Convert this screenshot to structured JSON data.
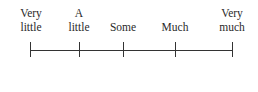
{
  "scale": {
    "anchors": [
      {
        "line1": "Very",
        "line2": "little"
      },
      {
        "line1": "A",
        "line2": "little"
      },
      {
        "line1": "",
        "line2": "Some"
      },
      {
        "line1": "",
        "line2": "Much"
      },
      {
        "line1": "Very",
        "line2": "much"
      }
    ],
    "tick_count": 5
  }
}
